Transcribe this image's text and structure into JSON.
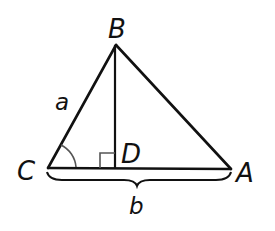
{
  "diagram": {
    "type": "triangle-with-altitude",
    "colors": {
      "stroke": "#111111",
      "angle_mark": "#555555",
      "background": "#ffffff"
    },
    "vertices": {
      "B": {
        "label": "B",
        "x": 116,
        "y": 45
      },
      "C": {
        "label": "C",
        "x": 48,
        "y": 168
      },
      "A": {
        "label": "A",
        "x": 231,
        "y": 169
      },
      "D": {
        "label": "D",
        "x": 115,
        "y": 168
      }
    },
    "side_labels": {
      "a": "a",
      "b": "b"
    },
    "markers": {
      "right_angle_at": "D",
      "angle_arc_at": "C"
    }
  }
}
